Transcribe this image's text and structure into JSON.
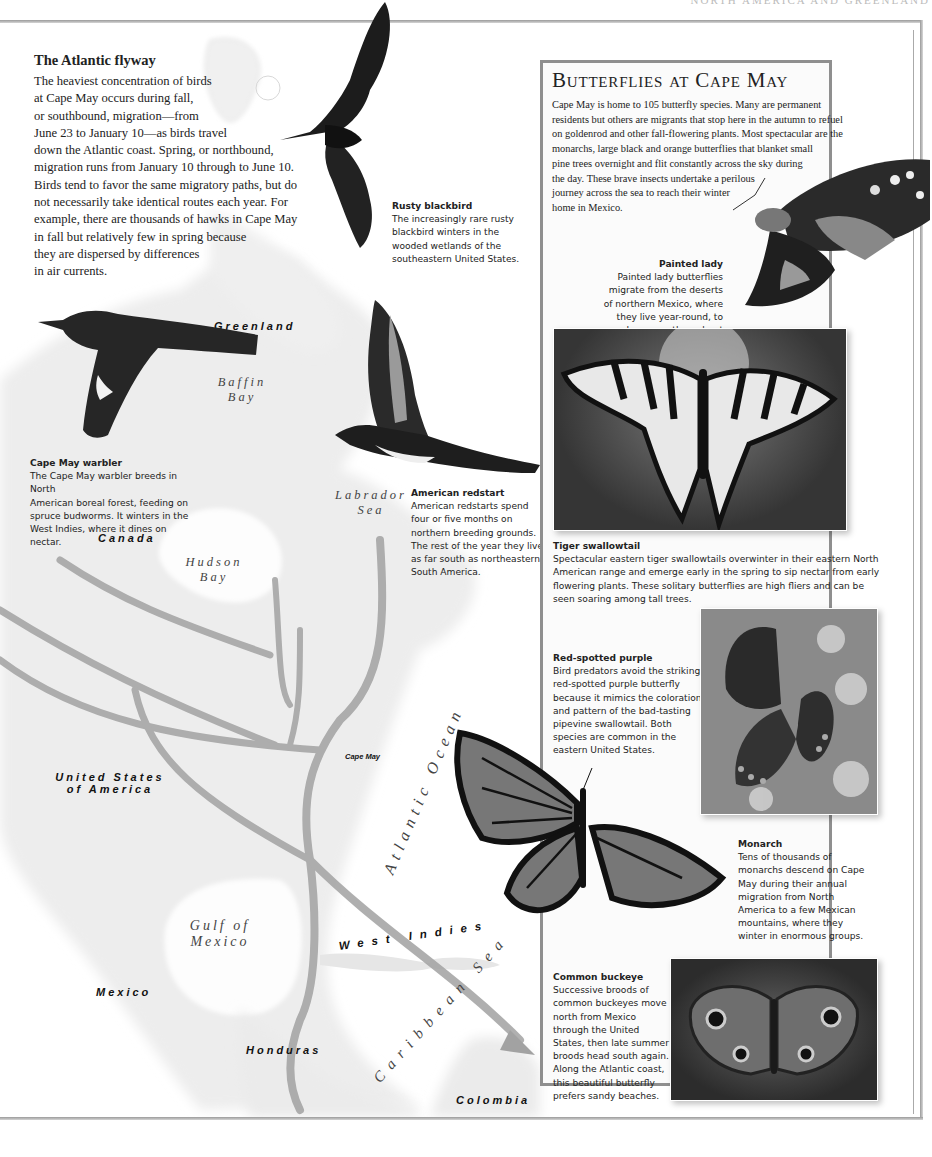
{
  "page": {
    "running_head": "NORTH AMERICA AND GREENLAND"
  },
  "intro": {
    "title": "The Atlantic flyway",
    "lines": [
      "The heaviest concentration of birds",
      "at Cape May occurs during fall,",
      "or southbound, migration—from",
      "June 23 to January 10—as birds travel",
      "down the Atlantic coast. Spring, or northbound,",
      "migration runs from January 10 through to June 10.",
      "Birds tend to favor the same migratory paths, but do",
      "not necessarily take identical routes each year. For",
      "example, there are thousands of hawks in Cape May",
      "in fall but relatively few in spring because",
      "they are dispersed by differences",
      "in air currents."
    ]
  },
  "birds": [
    {
      "title": "Rusty blackbird",
      "lines": [
        "The increasingly rare rusty",
        "blackbird winters in the",
        "wooded wetlands of the",
        "southeastern United States."
      ]
    },
    {
      "title": "Cape May warbler",
      "lines": [
        "The Cape May warbler breeds in North",
        "American boreal forest, feeding on",
        "spruce budworms. It winters in the",
        "West Indies, where it dines on nectar."
      ]
    },
    {
      "title": "American redstart",
      "lines": [
        "American redstarts spend",
        "four or five months on",
        "northern breeding grounds.",
        "The rest of the year they live",
        "as far south as northeastern",
        "South America."
      ]
    }
  ],
  "map_labels": {
    "greenland": "Greenland",
    "baffin_1": "Baffin",
    "baffin_2": "Bay",
    "labrador_1": "Labrador",
    "labrador_2": "Sea",
    "canada": "Canada",
    "hudson_1": "Hudson",
    "hudson_2": "Bay",
    "cape_may": "Cape May",
    "atlantic_ocean": "Atlantic Ocean",
    "usa_1": "United States",
    "usa_2": "of America",
    "gulf_1": "Gulf of",
    "gulf_2": "Mexico",
    "west_indies": "West Indies",
    "mexico": "Mexico",
    "caribbean_sea": "Caribbean Sea",
    "honduras": "Honduras",
    "colombia": "Colombia"
  },
  "sidebar": {
    "title": "Butterflies at Cape May",
    "lines": [
      "Cape May is home to 105 butterfly species. Many are permanent",
      "residents but others are migrants that stop here in the autumn to refuel",
      "on goldenrod and other fall-flowering plants. Most spectacular are the",
      "monarchs, large black and orange butterflies that blanket small",
      "pine trees overnight and flit constantly across the sky during",
      "the day. These brave insects undertake a perilous",
      "journey across the sea to reach their winter",
      "home in Mexico."
    ],
    "butterflies": [
      {
        "title": "Painted lady",
        "lines": [
          "Painted lady butterflies",
          "migrate from the deserts",
          "of northern Mexico, where",
          "they live year-round, to",
          "spend summer throughout",
          "North America."
        ]
      },
      {
        "title": "Tiger swallowtail",
        "lines": [
          "Spectacular eastern tiger swallowtails overwinter in their eastern North",
          "American range and emerge early in the spring to sip nectar from early",
          "flowering plants. These solitary butterflies are high fliers and can be",
          "seen soaring among tall trees."
        ]
      },
      {
        "title": "Red-spotted purple",
        "lines": [
          "Bird predators avoid the striking",
          "red-spotted purple butterfly",
          "because it mimics the coloration",
          "and pattern of the bad-tasting",
          "pipevine swallowtail. Both",
          "species are common in the",
          "eastern United States."
        ]
      },
      {
        "title": "Monarch",
        "lines": [
          "Tens of thousands of",
          "monarchs descend on Cape",
          "May during their annual",
          "migration from North",
          "America to a few Mexican",
          "mountains, where they",
          "winter in enormous groups."
        ]
      },
      {
        "title": "Common buckeye",
        "lines": [
          "Successive broods of",
          "common buckeyes move",
          "north from Mexico",
          "through the United",
          "States, then late summer",
          "broods head south again.",
          "Along the Atlantic coast,",
          "this beautiful butterfly",
          "prefers sandy beaches."
        ]
      }
    ]
  },
  "colors": {
    "frame": "#8f8f8f",
    "route": "#9c9c9c",
    "land": "#ececec",
    "text": "#222222"
  }
}
